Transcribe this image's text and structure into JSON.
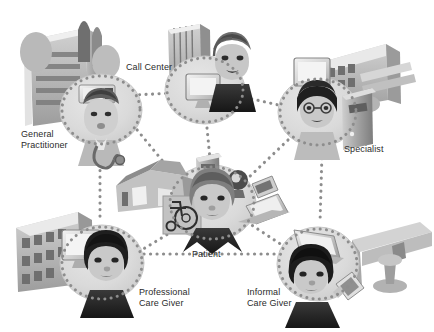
{
  "figure": {
    "type": "network-diagram",
    "background_color": "#ffffff",
    "palette": {
      "node_disc": "#d9d9d9",
      "node_disc_edge": "#c4c4c4",
      "connector_dot": "#8a8a8a",
      "label_text": "#2b2b2b",
      "figure_mid_gray": "#9a9a9a",
      "figure_dark_gray": "#4a4a4a",
      "figure_light_gray": "#e3e3e3",
      "hair_black": "#1e1e1e",
      "skin_gray": "#c9c9c9",
      "building_gray": "#b5b5b5"
    }
  },
  "nodes": [
    {
      "id": "general-practitioner",
      "label": "General\nPractitioner",
      "cx": 101,
      "cy": 110,
      "r": 41,
      "person": "doctor with stethoscope",
      "props": [
        "office-building",
        "trees",
        "desktop-monitor",
        "keyboard"
      ]
    },
    {
      "id": "call-center",
      "label": "Call Center",
      "cx": 205,
      "cy": 88,
      "r": 40,
      "person": "call-center agent with headset",
      "props": [
        "high-rise-building",
        "desktop-monitor"
      ]
    },
    {
      "id": "specialist",
      "label": "Specialist",
      "cx": 318,
      "cy": 112,
      "r": 40,
      "person": "specialist with eyeglasses",
      "props": [
        "hospital-building",
        "desktop-monitor",
        "pc-tower"
      ]
    },
    {
      "id": "patient",
      "label": "Patient",
      "cx": 212,
      "cy": 203,
      "r": 44,
      "person": "patient at home",
      "props": [
        "house",
        "wheelchair",
        "pc-tower",
        "webcam",
        "pda",
        "laptop"
      ]
    },
    {
      "id": "professional-care-giver",
      "label": "Professional\nCare Giver",
      "cx": 102,
      "cy": 263,
      "r": 42,
      "person": "nurse / professional carer",
      "props": [
        "care-facility-building",
        "desktop-monitor"
      ]
    },
    {
      "id": "informal-care-giver",
      "label": "Informal\nCare Giver",
      "cx": 318,
      "cy": 264,
      "r": 41,
      "person": "family member / informal carer",
      "props": [
        "laptop",
        "mobile-phone",
        "home-interior"
      ]
    }
  ],
  "connections": [
    {
      "from": "general-practitioner",
      "to": "call-center"
    },
    {
      "from": "general-practitioner",
      "to": "patient"
    },
    {
      "from": "general-practitioner",
      "to": "professional-care-giver"
    },
    {
      "from": "call-center",
      "to": "specialist"
    },
    {
      "from": "call-center",
      "to": "patient"
    },
    {
      "from": "specialist",
      "to": "patient"
    },
    {
      "from": "specialist",
      "to": "informal-care-giver"
    },
    {
      "from": "patient",
      "to": "professional-care-giver"
    },
    {
      "from": "patient",
      "to": "informal-care-giver"
    },
    {
      "from": "professional-care-giver",
      "to": "informal-care-giver"
    }
  ],
  "labels": {
    "general_practitioner": "General\nPractitioner",
    "call_center": "Call Center",
    "specialist": "Specialist",
    "patient": "Patient",
    "professional_care_giver": "Professional\nCare Giver",
    "informal_care_giver": "Informal\nCare Giver"
  }
}
